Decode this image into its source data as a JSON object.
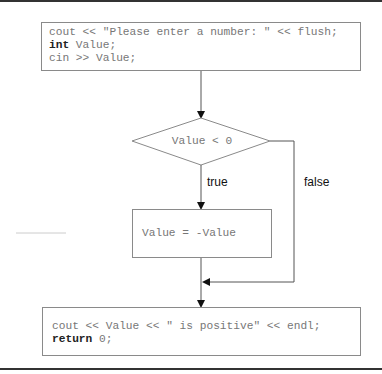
{
  "diagram": {
    "type": "flowchart",
    "nodes": {
      "start": {
        "shape": "rectangle",
        "lines": [
          {
            "keyword": "",
            "text": "cout << \"Please enter a number: \" << flush;"
          },
          {
            "keyword": "int",
            "text": " Value;"
          },
          {
            "keyword": "",
            "text": "cin >> Value;"
          }
        ]
      },
      "decision": {
        "shape": "diamond",
        "text": "Value < 0"
      },
      "negate": {
        "shape": "rectangle",
        "text": "Value = -Value"
      },
      "end": {
        "shape": "rectangle",
        "lines": [
          {
            "keyword": "",
            "text": "cout << Value << \" is positive\" << endl;"
          },
          {
            "keyword": "return",
            "text": " 0;"
          }
        ]
      }
    },
    "edges": {
      "true_label": "true",
      "false_label": "false"
    },
    "colors": {
      "stroke": "#8a8a8a",
      "code_text": "#777777",
      "keyword_text": "#222222",
      "label_text": "#111111",
      "rule": "#333333"
    }
  }
}
